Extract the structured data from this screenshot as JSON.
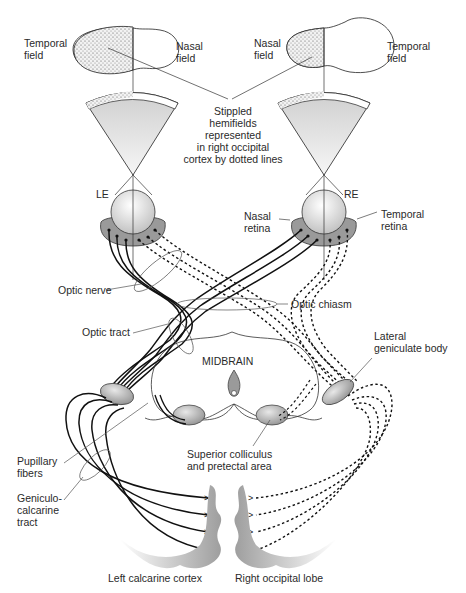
{
  "diagram": {
    "title_note": "Stippled hemifields represented in right occipital cortex by dotted lines",
    "labels": {
      "left_temporal_field": "Temporal\nfield",
      "left_nasal_field": "Nasal\nfield",
      "right_nasal_field": "Nasal\nfield",
      "right_temporal_field": "Temporal\nfield",
      "stippled_note": "Stippled\nhemifields\nrepresented\nin right occipital\ncortex by dotted lines",
      "left_eye": "LE",
      "right_eye": "RE",
      "nasal_retina": "Nasal\nretina",
      "temporal_retina": "Temporal\nretina",
      "optic_nerve": "Optic nerve",
      "optic_chiasm": "Optic chiasm",
      "optic_tract": "Optic tract",
      "lateral_geniculate_body": "Lateral\ngeniculate body",
      "midbrain": "MIDBRAIN",
      "pupillary_fibers": "Pupillary\nfibers",
      "superior_colliculus": "Superior colliculus\nand pretectal area",
      "geniculocalcarine_tract": "Geniculo-\ncalcarine\ntract",
      "left_calcarine_cortex": "Left calcarine cortex",
      "right_occipital_lobe": "Right occipital lobe"
    },
    "legend": {
      "solid_line": "Left visual pathway (to left occipital cortex)",
      "dotted_line": "Stippled hemifields (to right occipital cortex)"
    },
    "colors": {
      "line": "#1a1a1a",
      "structure_fill": "#9a9a9a",
      "eye_fill": "#e6e6e6",
      "cortex_fill": "#bdbdbd",
      "label_text": "#2a2a2a"
    }
  }
}
